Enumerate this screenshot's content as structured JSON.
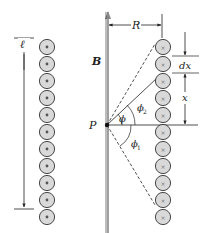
{
  "diagram": {
    "labels": {
      "length": "ℓ",
      "field": "B",
      "radius": "R",
      "point": "P",
      "element": "dx",
      "position": "x",
      "angle": "ϕ",
      "angle1": "ϕ",
      "angle1_sub": "1",
      "angle2": "ϕ",
      "angle2_sub": "2"
    },
    "left_column": {
      "symbol": "dot",
      "meaning": "current out of page",
      "count": 11
    },
    "right_column": {
      "symbol": "cross",
      "meaning": "current into page",
      "count": 11
    },
    "colors": {
      "circle_fill": "#d9d9d9",
      "circle_stroke": "#333333",
      "axis": "#888888",
      "line": "#222222"
    }
  }
}
